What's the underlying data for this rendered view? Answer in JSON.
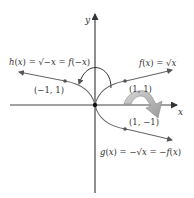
{
  "diagram": {
    "type": "function-reflection-graph",
    "axes": {
      "x_label": "x",
      "y_label": "y",
      "origin_px": [
        95,
        105
      ],
      "unit_px": 30,
      "axis_color": "#444444"
    },
    "curves": [
      {
        "id": "f",
        "label": "f(x) = √x",
        "point_label": "(1, 1)",
        "point": [
          1,
          1
        ],
        "color": "#666666"
      },
      {
        "id": "h",
        "label": "h(x) = √−x = f(−x)",
        "point_label": "(−1, 1)",
        "point": [
          -1,
          1
        ],
        "color": "#666666"
      },
      {
        "id": "g",
        "label": "g(x) = −√x = −f(x)",
        "point_label": "(1, −1)",
        "point": [
          1,
          -1
        ],
        "color": "#666666"
      }
    ],
    "annotations": {
      "reflect_y_axis_arrow": "curved thin arrow from f toward h (reflection in y-axis)",
      "reflect_x_axis_arrow": "broad gray curved arrow from f toward g (reflection in x-axis)",
      "broad_arrow_color": "#b8b8b8"
    }
  }
}
